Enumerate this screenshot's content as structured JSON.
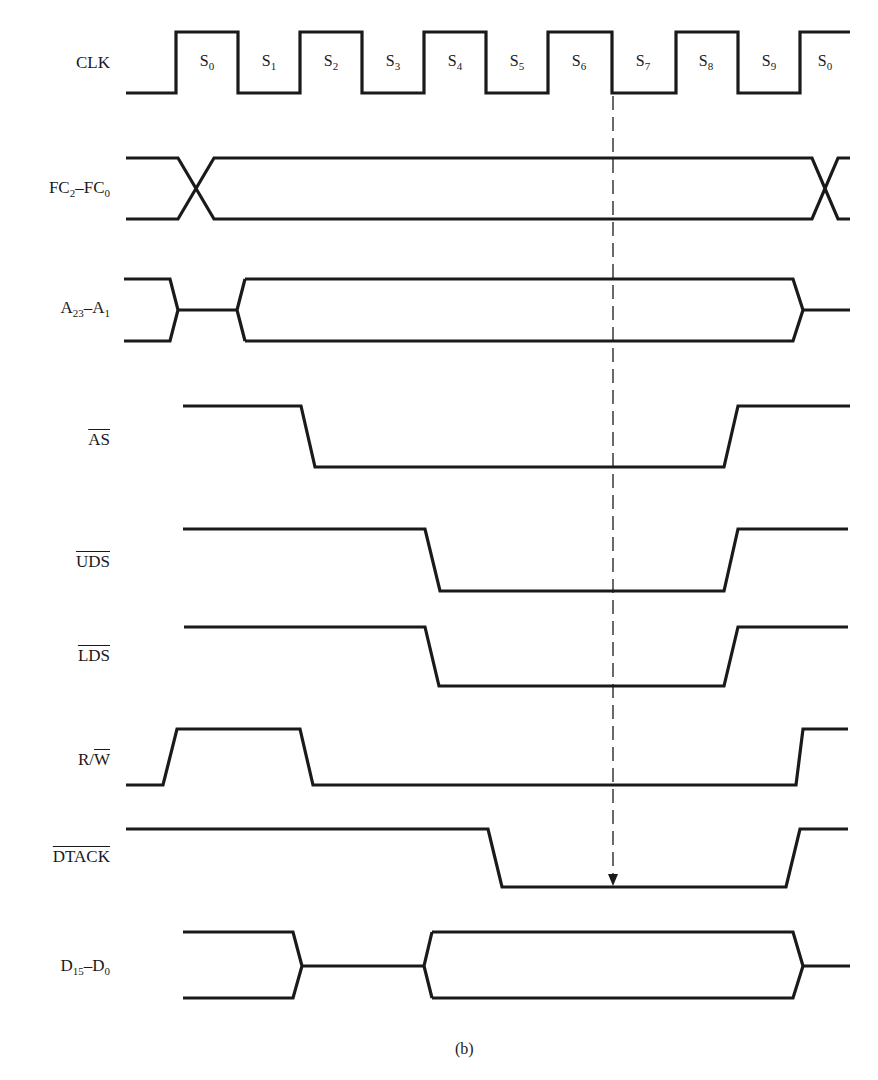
{
  "figure": {
    "caption": "(b)"
  },
  "clock": {
    "label": "CLK",
    "states": [
      {
        "name": "S",
        "sub": "0"
      },
      {
        "name": "S",
        "sub": "1"
      },
      {
        "name": "S",
        "sub": "2"
      },
      {
        "name": "S",
        "sub": "3"
      },
      {
        "name": "S",
        "sub": "4"
      },
      {
        "name": "S",
        "sub": "5"
      },
      {
        "name": "S",
        "sub": "6"
      },
      {
        "name": "S",
        "sub": "7"
      },
      {
        "name": "S",
        "sub": "8"
      },
      {
        "name": "S",
        "sub": "9"
      },
      {
        "name": "S",
        "sub": "0"
      }
    ]
  },
  "signals": [
    {
      "id": "fc",
      "label_main": "FC",
      "sub1": "2",
      "mid": "–FC",
      "sub2": "0",
      "kind": "bus"
    },
    {
      "id": "addr",
      "label_main": "A",
      "sub1": "23",
      "mid": "–A",
      "sub2": "1",
      "kind": "bus"
    },
    {
      "id": "as",
      "label": "AS",
      "active_low": true
    },
    {
      "id": "uds",
      "label": "UDS",
      "active_low": true
    },
    {
      "id": "lds",
      "label": "LDS",
      "active_low": true
    },
    {
      "id": "rw",
      "label_r": "R/",
      "label_w": "W"
    },
    {
      "id": "dtack",
      "label": "DTACK",
      "active_low": true
    },
    {
      "id": "data",
      "label_main": "D",
      "sub1": "15",
      "mid": "–D",
      "sub2": "0",
      "kind": "bus"
    }
  ],
  "marker": {
    "type": "dashed-arrow",
    "from": "CLK falling edge S6/S7",
    "to": "DTACK low"
  }
}
